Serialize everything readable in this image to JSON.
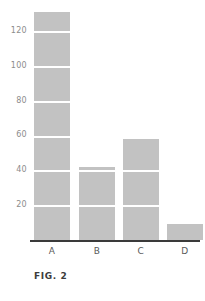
{
  "figure": {
    "caption": "FIG. 2"
  },
  "chart_data": {
    "type": "bar",
    "title": "",
    "xlabel": "",
    "ylabel": "",
    "categories": [
      "A",
      "B",
      "C",
      "D"
    ],
    "values": [
      131,
      42,
      58,
      9
    ],
    "ylim": [
      0,
      135
    ],
    "yticks": [
      20,
      40,
      60,
      80,
      100,
      120
    ],
    "ytick_labels": [
      "20",
      "40",
      "60",
      "80",
      "100",
      "120"
    ],
    "grid": "horizontal-white-over-bars",
    "legend": "none",
    "bar_color": "#c2c2c2",
    "axis_color": "#3a3a3a",
    "gridline_color": "#ffffff",
    "tick_label_color": "#8c8c8c"
  }
}
